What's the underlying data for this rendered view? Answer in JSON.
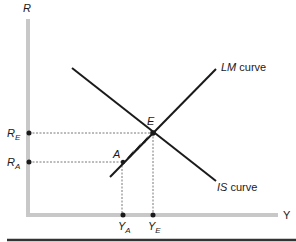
{
  "diagram": {
    "axes": {
      "y_label": "R",
      "x_label": "Y"
    },
    "curves": {
      "lm": {
        "label_italic": "LM",
        "label_rest": " curve"
      },
      "is": {
        "label_italic": "IS",
        "label_rest": " curve"
      }
    },
    "points": {
      "equilibrium": {
        "label": "E"
      },
      "initial": {
        "label": "A"
      }
    },
    "tick_labels": {
      "r_e": {
        "main": "R",
        "sub": "E"
      },
      "r_a": {
        "main": "R",
        "sub": "A"
      },
      "y_a": {
        "main": "Y",
        "sub": "A"
      },
      "y_e": {
        "main": "Y",
        "sub": "E"
      }
    },
    "colors": {
      "axis": "#c8c8c8",
      "line": "#1a1a1a",
      "dashed": "#555555",
      "rule": "#333333"
    }
  }
}
